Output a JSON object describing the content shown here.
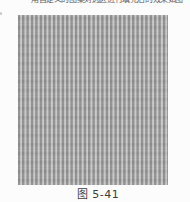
{
  "page": {
    "background": "#fcfcfc",
    "top_clipped_text": "用自定义的图案对选区进行填充后的效果如图—"
  },
  "figure": {
    "caption": "图 5-41",
    "pattern": {
      "type": "vertical-stripes",
      "stripe_dark": "#8e8e8e",
      "stripe_mid": "#aeaeae",
      "stripe_light": "#c7c7c7",
      "period_px": 4.4,
      "panel_width_px": 150,
      "panel_height_px": 170
    }
  }
}
